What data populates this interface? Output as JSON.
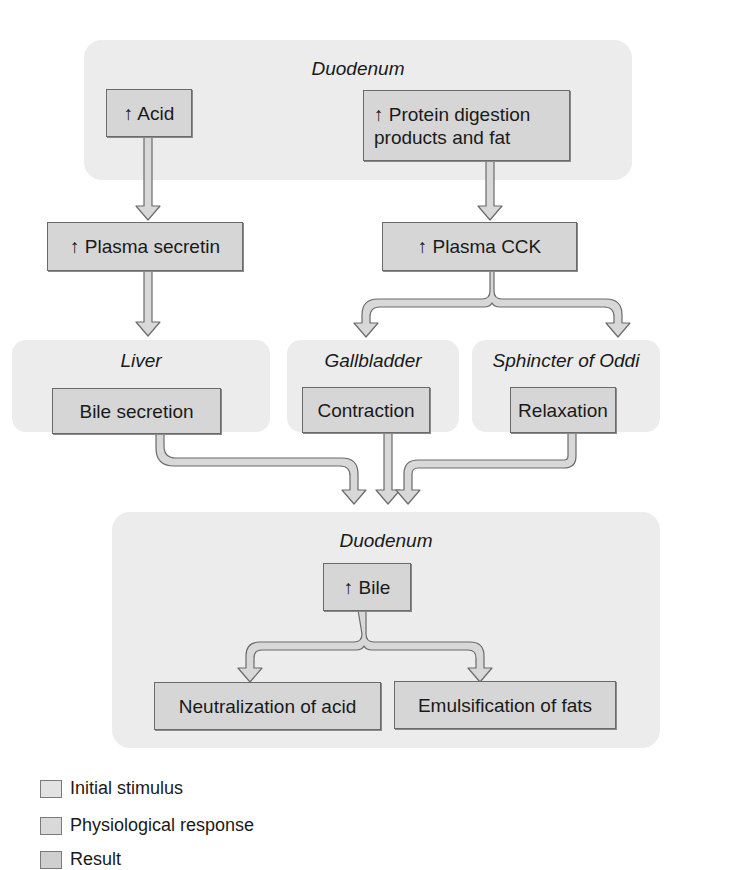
{
  "diagram": {
    "top_region": {
      "title": "Duodenum",
      "stimuli": [
        {
          "label": "↑ Acid"
        },
        {
          "label": "↑ Protein digestion products and fat"
        }
      ]
    },
    "hormones": [
      {
        "label": "↑ Plasma secretin"
      },
      {
        "label": "↑ Plasma CCK"
      }
    ],
    "organs": [
      {
        "title": "Liver",
        "response": "Bile secretion"
      },
      {
        "title": "Gallbladder",
        "response": "Contraction"
      },
      {
        "title": "Sphincter of Oddi",
        "response": "Relaxation"
      }
    ],
    "bottom_region": {
      "title": "Duodenum",
      "bile": "↑ Bile",
      "results": [
        {
          "label": "Neutralization of acid"
        },
        {
          "label": "Emulsification of fats"
        }
      ]
    }
  },
  "legend": [
    {
      "label": "Initial stimulus",
      "color": "#e2e2e2"
    },
    {
      "label": "Physiological response",
      "color": "#d9d9d9"
    },
    {
      "label": "Result",
      "color": "#cfcfcf"
    }
  ],
  "colors": {
    "region_bg": "#ececec",
    "box_fill": "#d6d6d6",
    "box_border": "#6a6a6a",
    "arrow_fill": "#d8d8d8",
    "arrow_stroke": "#6a6a6a"
  }
}
